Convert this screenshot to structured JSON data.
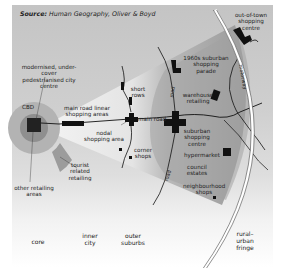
{
  "source": {
    "prefix": "Source:",
    "text": "Human Geography, Oliver & Boyd"
  },
  "labels": {
    "cbd": "CBD",
    "modernised": "modernised, under-cover\npedestrianised city centre",
    "main_road_linear": "main road linear\nshopping areas",
    "nodal": "nodal\nshopping area",
    "short_rows": "short\nrows",
    "corner_shops": "corner\nshops",
    "main_road": "main road",
    "road": "road",
    "road2": "road",
    "parade": "1960s suburban\nshopping\nparade",
    "warehouse": "warehouse\nretailing",
    "suburban_centre": "suburban\nshopping\ncentre",
    "hypermarket": "hypermarket",
    "council_estates": "council\nestates",
    "neighbourhood_shops": "neighbourhood\nshops",
    "out_of_town": "out-of-town\nshopping\ncentre",
    "motorway": "motorway",
    "tourist": "tourist\nrelated\nretailing",
    "other_retailing": "other retailing\nareas"
  },
  "zones": [
    {
      "id": "core",
      "label": "core"
    },
    {
      "id": "inner-city",
      "label": "inner\ncity"
    },
    {
      "id": "outer-suburbs",
      "label": "outer\nsuburbs"
    },
    {
      "id": "rural-urban-fringe",
      "label": "rural–\nurban\nfringe"
    }
  ],
  "colors": {
    "background_top": "#c4c4c4",
    "cbd_outer": "#a9a9a9",
    "cbd_inner": "#8a8a8a",
    "wedge_light": "#e9e9e9",
    "wedge_dark": "#9d9d9d",
    "block": "#111111",
    "motorway": "#ffffff"
  }
}
